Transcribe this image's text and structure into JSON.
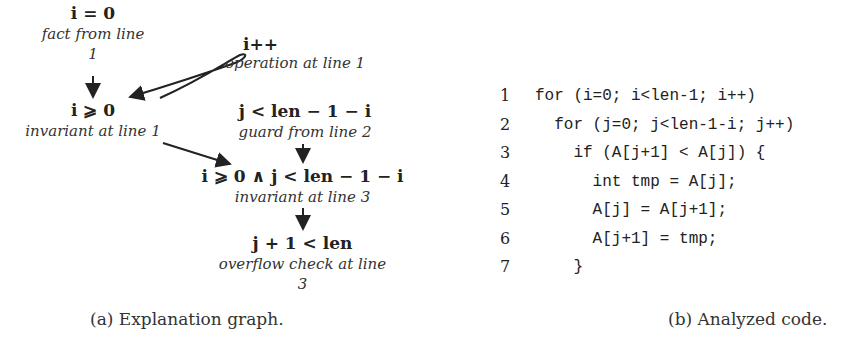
{
  "graph": {
    "nodes": [
      {
        "id": "n1",
        "formula": "i = 0",
        "label": "fact from line",
        "label2": "1"
      },
      {
        "id": "n2",
        "formula": "i++",
        "label": "operation at line 1"
      },
      {
        "id": "n3",
        "formula": "i ⩾ 0",
        "label": "invariant at line 1"
      },
      {
        "id": "n4",
        "formula": "j < len − 1 − i",
        "label": "guard from line 2"
      },
      {
        "id": "n5",
        "formula": "i ⩾ 0 ∧ j < len − 1 − i",
        "label": "invariant at line 3"
      },
      {
        "id": "n6",
        "formula": "j + 1 < len",
        "label": "overflow check at line",
        "label2": "3"
      }
    ],
    "edges": [
      {
        "from": "n1",
        "to": "n3"
      },
      {
        "from": "n2",
        "to": "n3"
      },
      {
        "from": "n3",
        "to": "n5"
      },
      {
        "from": "n4",
        "to": "n5"
      },
      {
        "from": "n5",
        "to": "n6"
      }
    ]
  },
  "code": {
    "lines": [
      {
        "num": "1",
        "text": "for (i=0; i<len-1; i++)"
      },
      {
        "num": "2",
        "text": "  for (j=0; j<len-1-i; j++)"
      },
      {
        "num": "3",
        "text": "    if (A[j+1] < A[j]) {"
      },
      {
        "num": "4",
        "text": "      int tmp = A[j];"
      },
      {
        "num": "5",
        "text": "      A[j] = A[j+1];"
      },
      {
        "num": "6",
        "text": "      A[j+1] = tmp;"
      },
      {
        "num": "7",
        "text": "    }"
      }
    ]
  },
  "captions": {
    "a": "(a) Explanation graph.",
    "b": "(b) Analyzed code."
  }
}
